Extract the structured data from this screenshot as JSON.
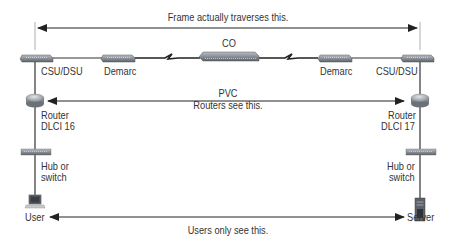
{
  "diagram": {
    "annotations": {
      "frame_path": "Frame actually traverses this.",
      "pvc_title": "PVC",
      "pvc_sub": "Routers see this.",
      "users_path": "Users only see this."
    },
    "left": {
      "csu_dsu": "CSU/DSU",
      "demarc": "Demarc",
      "router_line1": "Router",
      "router_line2": "DLCI 16",
      "hub_line1": "Hub or",
      "hub_line2": "switch",
      "endpoint": "User"
    },
    "center": {
      "co": "CO"
    },
    "right": {
      "csu_dsu": "CSU/DSU",
      "demarc": "Demarc",
      "router_line1": "Router",
      "router_line2": "DLCI 17",
      "hub_line1": "Hub or",
      "hub_line2": "switch",
      "endpoint": "Server"
    },
    "colors": {
      "line": "#333333",
      "device": "#8a8f96",
      "device_dark": "#5c6168"
    }
  }
}
